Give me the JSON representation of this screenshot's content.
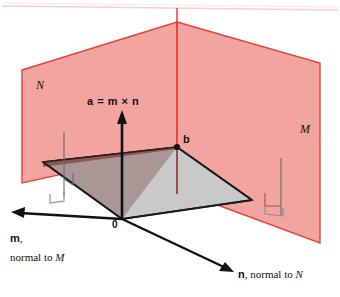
{
  "figure": {
    "background_color": "#ffffff",
    "width": 340,
    "height": 297
  },
  "colors": {
    "plane_fill": "#f2a49f",
    "plane_edge": "#e8403a",
    "plane_overlap": "#8d5a57",
    "base_plane_fill": "#c9c9c9",
    "base_plane_edge": "#1a1a1a",
    "axis": "#111111",
    "vertical_red_line": "#e8403a",
    "vertical_dark_red_line": "#7c2a26",
    "right_angle_marker": "#6b6b6b",
    "scan_artifact": "#f6cfc9",
    "text": "#111111"
  },
  "labels": {
    "plane_n": "N",
    "plane_m": "M",
    "cross_product": "a = m × n",
    "point_b": "b",
    "origin": "0",
    "m_axis": {
      "vector": "m",
      "comma": ",",
      "description": "normal to ",
      "plane": "M"
    },
    "n_axis": {
      "vector": "n",
      "comma": ",",
      "description": " normal to ",
      "plane": "N"
    }
  },
  "geometry": {
    "origin_px": [
      122,
      219
    ],
    "point_b_px": [
      177,
      147
    ],
    "apex_px": [
      177,
      22
    ],
    "a_arrow_tip_px": [
      122,
      113
    ],
    "m_arrow_tip_px": [
      12,
      213
    ],
    "n_arrow_tip_px": [
      232,
      272
    ]
  }
}
